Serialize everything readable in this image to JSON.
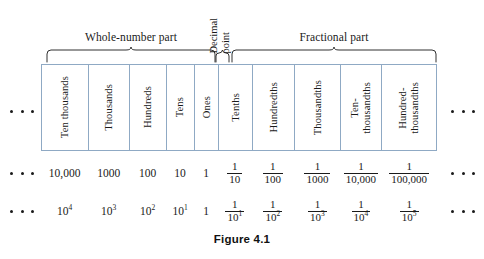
{
  "figure": {
    "caption": "Figure 4.1",
    "border_color": "#8fa9c4",
    "text_color": "#1a1a1a"
  },
  "groups": {
    "whole_number": "Whole-number part",
    "decimal_point_line1": "Decimal",
    "decimal_point_line2": "point",
    "fractional": "Fractional part"
  },
  "columns": [
    {
      "label": "Ten thousands",
      "decimal_value": "10,000",
      "power_base": "10",
      "power_exp": "4",
      "kind": "whole"
    },
    {
      "label": "Thousands",
      "decimal_value": "1000",
      "power_base": "10",
      "power_exp": "3",
      "kind": "whole"
    },
    {
      "label": "Hundreds",
      "decimal_value": "100",
      "power_base": "10",
      "power_exp": "2",
      "kind": "whole"
    },
    {
      "label": "Tens",
      "decimal_value": "10",
      "power_base": "10",
      "power_exp": "1",
      "kind": "whole"
    },
    {
      "label": "Ones",
      "decimal_value": "1",
      "power_base": "1",
      "power_exp": "",
      "kind": "whole"
    },
    {
      "label": "Tenths",
      "frac_num": "1",
      "frac_den": "10",
      "pow_den_base": "10",
      "pow_den_exp": "1",
      "kind": "fraction"
    },
    {
      "label": "Hundredths",
      "frac_num": "1",
      "frac_den": "100",
      "pow_den_base": "10",
      "pow_den_exp": "2",
      "kind": "fraction"
    },
    {
      "label": "Thousandths",
      "frac_num": "1",
      "frac_den": "1000",
      "pow_den_base": "10",
      "pow_den_exp": "3",
      "kind": "fraction"
    },
    {
      "label": "Ten-\nthousandths",
      "frac_num": "1",
      "frac_den": "10,000",
      "pow_den_base": "10",
      "pow_den_exp": "4",
      "kind": "fraction"
    },
    {
      "label": "Hundred-\nthousandths",
      "frac_num": "1",
      "frac_den": "100,000",
      "pow_den_base": "10",
      "pow_den_exp": "5",
      "kind": "fraction"
    }
  ],
  "ellipsis": {
    "dot_count": 3
  }
}
